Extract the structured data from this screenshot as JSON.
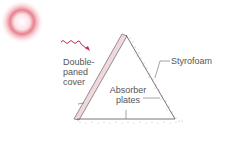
{
  "diagram": {
    "type": "solar collector cross-section",
    "labels": {
      "cover_line1": "Double-",
      "cover_line2": "paned",
      "cover_line3": "cover",
      "styrofoam": "Styrofoam",
      "absorber_line1": "Absorber",
      "absorber_line2": "plates"
    },
    "colors": {
      "sun": "#e87a8a",
      "ray": "#c0304a",
      "outline": "#555555",
      "cover": "#f0d8dc",
      "styrofoam_dots": "#aaaaaa",
      "label_text": "#555555"
    }
  }
}
